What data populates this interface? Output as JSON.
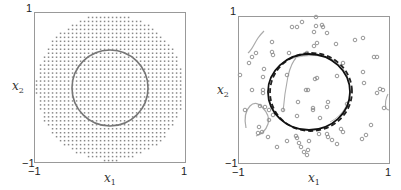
{
  "chart_data": [
    {
      "type": "scatter",
      "title": "",
      "xlabel": "x1",
      "ylabel": "x2",
      "xlim": [
        -1,
        1
      ],
      "ylim": [
        -1,
        1
      ],
      "grid": false,
      "x_ticks": [
        "-1",
        "1"
      ],
      "y_ticks": [
        "-1",
        "1"
      ],
      "description": "Dense regular grid of points filling a disc of radius ~0.98; a gray circle (decision boundary) of radius ~0.5 centered at origin",
      "series": [
        {
          "name": "grid points",
          "kind": "grid-disc",
          "radius": 0.98,
          "spacing": 0.053,
          "color": "#888888"
        },
        {
          "name": "true boundary",
          "kind": "circle",
          "center": [
            0,
            0
          ],
          "radius": 0.5,
          "color": "#7a7a7a"
        }
      ]
    },
    {
      "type": "scatter",
      "title": "",
      "xlabel": "x1",
      "ylabel": "x2",
      "xlim": [
        -1,
        1
      ],
      "ylim": [
        -1,
        1
      ],
      "grid": false,
      "x_ticks": [
        "-1",
        "1"
      ],
      "y_ticks": [
        "-1",
        "1"
      ],
      "description": "Randomly sampled points (open circles) with estimated boundaries: solid black circle, dashed circle, and gray spurious curves",
      "series": [
        {
          "name": "sample points",
          "kind": "points",
          "marker": "open-circle",
          "color": "#8a8a8a",
          "points_px": [
            [
              316,
              17
            ],
            [
              302,
              22
            ],
            [
              292,
              27
            ],
            [
              297,
              27
            ],
            [
              316,
              26
            ],
            [
              322,
              25
            ],
            [
              323,
              27
            ],
            [
              314,
              32
            ],
            [
              327,
              33
            ],
            [
              272,
              42
            ],
            [
              317,
              43
            ],
            [
              314,
              46
            ],
            [
              336,
              44
            ],
            [
              355,
              40
            ],
            [
              363,
              38
            ],
            [
              256,
              53
            ],
            [
              272,
              52
            ],
            [
              273,
              55
            ],
            [
              289,
              53
            ],
            [
              307,
              53
            ],
            [
              343,
              63
            ],
            [
              374,
              57
            ],
            [
              377,
              57
            ],
            [
              252,
              57
            ],
            [
              249,
              63
            ],
            [
              240,
              75
            ],
            [
              264,
              69
            ],
            [
              263,
              77
            ],
            [
              287,
              75
            ],
            [
              315,
              79
            ],
            [
              317,
              78
            ],
            [
              337,
              76
            ],
            [
              363,
              72
            ],
            [
              364,
              83
            ],
            [
              252,
              90
            ],
            [
              263,
              90
            ],
            [
              263,
              93
            ],
            [
              306,
              90
            ],
            [
              308,
              90
            ],
            [
              377,
              93
            ],
            [
              380,
              89
            ],
            [
              383,
              90
            ],
            [
              245,
              110
            ],
            [
              260,
              106
            ],
            [
              265,
              107
            ],
            [
              269,
              110
            ],
            [
              298,
              102
            ],
            [
              313,
              108
            ],
            [
              313,
              110
            ],
            [
              327,
              107
            ],
            [
              328,
              102
            ],
            [
              347,
              104
            ],
            [
              384,
              108
            ],
            [
              273,
              115
            ],
            [
              283,
              110
            ],
            [
              297,
              116
            ],
            [
              320,
              118
            ],
            [
              269,
              120
            ],
            [
              259,
              127
            ],
            [
              341,
              129
            ],
            [
              343,
              132
            ],
            [
              371,
              125
            ],
            [
              268,
              137
            ],
            [
              287,
              141
            ],
            [
              296,
              136
            ],
            [
              297,
              138
            ],
            [
              299,
              143
            ],
            [
              309,
              141
            ],
            [
              319,
              134
            ],
            [
              327,
              134
            ],
            [
              328,
              137
            ],
            [
              332,
              140
            ],
            [
              337,
              144
            ],
            [
              362,
              139
            ],
            [
              366,
              135
            ],
            [
              277,
              147
            ],
            [
              301,
              147
            ],
            [
              308,
              150
            ],
            [
              304,
              152
            ],
            [
              307,
              155
            ],
            [
              262,
              132
            ],
            [
              258,
              133
            ]
          ]
        },
        {
          "name": "estimated boundary (solid)",
          "kind": "circle",
          "center": [
            -0.02,
            0.0
          ],
          "radius": 0.53,
          "color": "#111111"
        },
        {
          "name": "estimated boundary (dashed)",
          "kind": "circle",
          "center": [
            0.02,
            0.0
          ],
          "radius": 0.52,
          "color": "#222222",
          "dash": true
        },
        {
          "name": "spurious boundary (gray)",
          "kind": "curves",
          "color": "#999999"
        }
      ]
    }
  ],
  "left": {
    "tick_top": "1",
    "tick_bottom_y": "−1",
    "tick_left_x": "−1",
    "tick_right_x": "1",
    "xlabel": "x",
    "xlabel_sub": "1",
    "ylabel": "x",
    "ylabel_sub": "2"
  },
  "right": {
    "tick_top": "1",
    "tick_bottom_y": "−1",
    "tick_left_x": "−1",
    "tick_right_x": "1",
    "xlabel": "x",
    "xlabel_sub": "1",
    "ylabel": "x",
    "ylabel_sub": "2"
  }
}
